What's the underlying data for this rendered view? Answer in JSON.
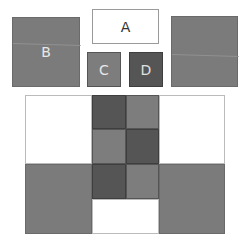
{
  "pieces": {
    "a": {
      "label": "A",
      "color": "#ffffff"
    },
    "b": {
      "label": "B",
      "color": "#7b7b7b"
    },
    "c": {
      "label": "C",
      "color": "#7d7d7d"
    },
    "d": {
      "label": "D",
      "color": "#555555"
    },
    "e": {
      "label": "",
      "color": "#7b7b7b"
    }
  },
  "grid": {
    "rows": 2,
    "cells": [
      [
        "white",
        "dark",
        "mid",
        "white"
      ],
      [
        "white",
        "mid",
        "dark",
        "white"
      ],
      [
        "gray",
        "dark",
        "mid",
        "gray"
      ],
      [
        "gray",
        "white",
        "white",
        "gray"
      ]
    ]
  }
}
